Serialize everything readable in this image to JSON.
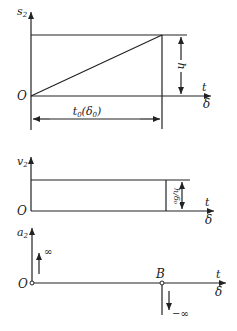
{
  "diagram": {
    "type": "cam-follower uniform-motion curves",
    "panels": [
      {
        "id": "displacement",
        "y_axis_label": "s₂",
        "origin_label": "O",
        "x_axis_labels": [
          "t",
          "δ"
        ],
        "height_label": "h",
        "width_label": "t₀(δ₀)",
        "curve": "straight line from origin to (t0, h)"
      },
      {
        "id": "velocity",
        "y_axis_label": "v₂",
        "origin_label": "O",
        "x_axis_labels": [
          "t",
          "δ"
        ],
        "height_label": "h/δ₀",
        "curve": "constant value h/δ0 over [0, t0]"
      },
      {
        "id": "acceleration",
        "y_axis_label": "a₂",
        "origin_label": "O",
        "x_axis_labels": [
          "t",
          "δ"
        ],
        "point_label": "B",
        "impulse_up_label": "∞",
        "impulse_down_label": "−∞",
        "curve": "zero with impulses +∞ at O and −∞ at B"
      }
    ]
  },
  "labels": {
    "s2_base": "s",
    "s2_sub": "2",
    "v2_base": "v",
    "v2_sub": "2",
    "a2_base": "a",
    "a2_sub": "2",
    "origin": "O",
    "t": "t",
    "delta": "δ",
    "h": "h",
    "t0_base": "t",
    "t0_sub": "0",
    "t0_open": "(δ",
    "t0_sub2": "0",
    "t0_close": ")",
    "h_over_delta0": "h/δ₀",
    "B": "B",
    "inf": "∞",
    "neg_inf": "−∞"
  }
}
